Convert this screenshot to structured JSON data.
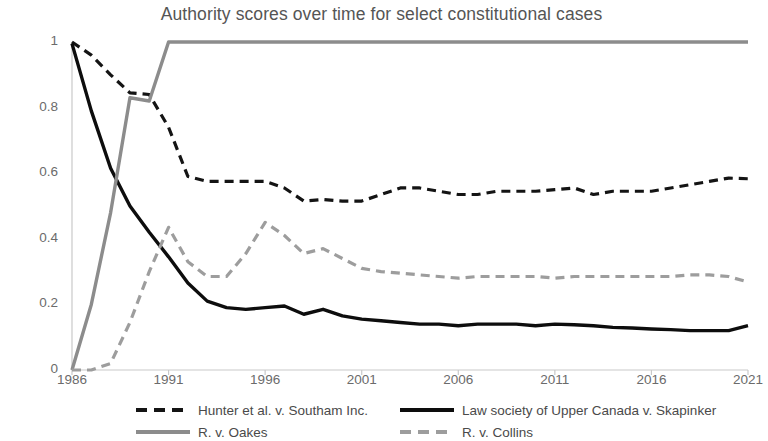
{
  "chart_data": {
    "type": "line",
    "title": "Authority scores over time for select constitutional cases",
    "xlabel": "",
    "ylabel": "",
    "xlim": [
      1986,
      2021
    ],
    "ylim": [
      0,
      1
    ],
    "grid": false,
    "legend_position": "bottom",
    "x": [
      1986,
      1987,
      1988,
      1989,
      1990,
      1991,
      1992,
      1993,
      1994,
      1995,
      1996,
      1997,
      1998,
      1999,
      2000,
      2001,
      2002,
      2003,
      2004,
      2005,
      2006,
      2007,
      2008,
      2009,
      2010,
      2011,
      2012,
      2013,
      2014,
      2015,
      2016,
      2017,
      2018,
      2019,
      2020,
      2021
    ],
    "xticks": [
      1986,
      1991,
      1996,
      2001,
      2006,
      2011,
      2016,
      2021
    ],
    "xtick_labels": [
      "1986",
      "1991",
      "1996",
      "2001",
      "2006",
      "2011",
      "2016",
      "2021"
    ],
    "yticks": [
      0,
      0.2,
      0.4,
      0.6,
      0.8,
      1
    ],
    "ytick_labels": [
      "0",
      "0.2",
      "0.4",
      "0.6",
      "0.8",
      "1"
    ],
    "series": [
      {
        "name": "Hunter et al. v. Southam Inc.",
        "color": "#141414",
        "style": "dashed",
        "width": 3.2,
        "values": [
          1.0,
          0.96,
          0.9,
          0.845,
          0.84,
          0.74,
          0.59,
          0.575,
          0.575,
          0.575,
          0.575,
          0.555,
          0.515,
          0.52,
          0.515,
          0.515,
          0.535,
          0.555,
          0.555,
          0.545,
          0.535,
          0.535,
          0.545,
          0.545,
          0.545,
          0.55,
          0.555,
          0.535,
          0.545,
          0.545,
          0.545,
          0.555,
          0.565,
          0.575,
          0.585,
          0.583
        ]
      },
      {
        "name": "Law society of Upper Canada v. Skapinker",
        "color": "#0d0d0d",
        "style": "solid",
        "width": 3.4,
        "values": [
          0.995,
          0.79,
          0.615,
          0.5,
          0.42,
          0.345,
          0.265,
          0.21,
          0.19,
          0.185,
          0.19,
          0.195,
          0.17,
          0.185,
          0.165,
          0.155,
          0.15,
          0.145,
          0.14,
          0.14,
          0.135,
          0.14,
          0.14,
          0.14,
          0.135,
          0.14,
          0.138,
          0.135,
          0.13,
          0.128,
          0.125,
          0.123,
          0.12,
          0.12,
          0.12,
          0.135
        ]
      },
      {
        "name": "R. v. Oakes",
        "color": "#8c8c8c",
        "style": "solid",
        "width": 3.4,
        "values": [
          0.0,
          0.2,
          0.48,
          0.83,
          0.82,
          1.0,
          1.0,
          1.0,
          1.0,
          1.0,
          1.0,
          1.0,
          1.0,
          1.0,
          1.0,
          1.0,
          1.0,
          1.0,
          1.0,
          1.0,
          1.0,
          1.0,
          1.0,
          1.0,
          1.0,
          1.0,
          1.0,
          1.0,
          1.0,
          1.0,
          1.0,
          1.0,
          1.0,
          1.0,
          1.0,
          1.0
        ]
      },
      {
        "name": "R. v. Collins",
        "color": "#9d9d9d",
        "style": "dashed",
        "width": 3.2,
        "values": [
          0.0,
          0.0,
          0.02,
          0.145,
          0.3,
          0.435,
          0.33,
          0.285,
          0.285,
          0.355,
          0.45,
          0.41,
          0.355,
          0.37,
          0.34,
          0.31,
          0.3,
          0.295,
          0.29,
          0.285,
          0.28,
          0.285,
          0.285,
          0.285,
          0.285,
          0.28,
          0.285,
          0.285,
          0.285,
          0.285,
          0.285,
          0.285,
          0.29,
          0.29,
          0.285,
          0.268
        ]
      }
    ]
  },
  "legend": {
    "items": [
      {
        "label": "Hunter et al. v. Southam Inc."
      },
      {
        "label": "Law society of Upper Canada v. Skapinker"
      },
      {
        "label": "R. v. Oakes"
      },
      {
        "label": "R. v. Collins"
      }
    ]
  }
}
